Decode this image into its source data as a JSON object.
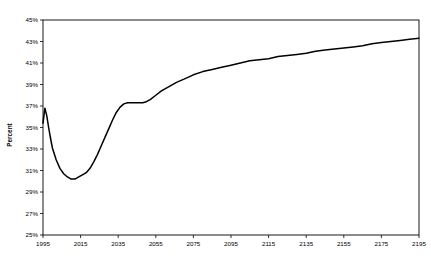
{
  "chart_data": {
    "type": "line",
    "title": "",
    "xlabel": "",
    "ylabel": "Percent",
    "xlim": [
      1995,
      2195
    ],
    "ylim": [
      25,
      45
    ],
    "grid": false,
    "legend": null,
    "x_ticks": [
      "1995",
      "2015",
      "2035",
      "2055",
      "2075",
      "2095",
      "2115",
      "2135",
      "2155",
      "2175",
      "2195"
    ],
    "x_tick_values": [
      1995,
      2015,
      2035,
      2055,
      2075,
      2095,
      2115,
      2135,
      2155,
      2175,
      2195
    ],
    "y_ticks": [
      "25%",
      "27%",
      "29%",
      "31%",
      "33%",
      "35%",
      "37%",
      "39%",
      "41%",
      "43%",
      "45%"
    ],
    "y_tick_values": [
      25,
      27,
      29,
      31,
      33,
      35,
      37,
      39,
      41,
      43,
      45
    ],
    "series": [
      {
        "name": "Percent",
        "color": "#000000",
        "x": [
          1995,
          1996,
          1997,
          1998,
          1999,
          2000,
          2002,
          2004,
          2006,
          2008,
          2010,
          2012,
          2014,
          2016,
          2018,
          2020,
          2022,
          2024,
          2026,
          2028,
          2030,
          2032,
          2034,
          2036,
          2038,
          2040,
          2042,
          2044,
          2046,
          2048,
          2050,
          2052,
          2055,
          2058,
          2062,
          2066,
          2070,
          2075,
          2080,
          2085,
          2090,
          2095,
          2100,
          2105,
          2110,
          2115,
          2120,
          2125,
          2130,
          2135,
          2140,
          2145,
          2150,
          2155,
          2160,
          2165,
          2170,
          2175,
          2180,
          2185,
          2190,
          2195
        ],
        "y": [
          35.4,
          36.8,
          36.1,
          35.0,
          34.0,
          33.1,
          32.0,
          31.2,
          30.7,
          30.4,
          30.2,
          30.2,
          30.4,
          30.6,
          30.8,
          31.2,
          31.8,
          32.5,
          33.3,
          34.1,
          34.9,
          35.7,
          36.4,
          36.9,
          37.2,
          37.3,
          37.3,
          37.3,
          37.3,
          37.3,
          37.4,
          37.6,
          38.0,
          38.4,
          38.8,
          39.2,
          39.5,
          39.9,
          40.2,
          40.4,
          40.6,
          40.8,
          41.0,
          41.2,
          41.3,
          41.4,
          41.6,
          41.7,
          41.8,
          41.9,
          42.1,
          42.2,
          42.3,
          42.4,
          42.5,
          42.6,
          42.8,
          42.9,
          43.0,
          43.1,
          43.2,
          43.3
        ]
      }
    ]
  },
  "axes": {
    "ylabel_text": "Percent"
  }
}
